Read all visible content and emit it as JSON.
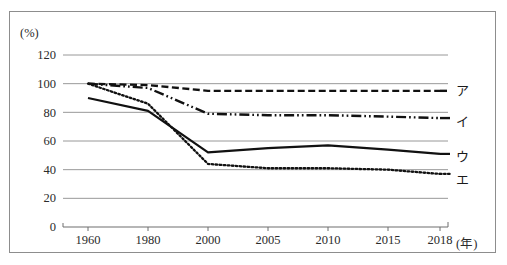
{
  "chart_data": {
    "type": "line",
    "title": "",
    "subtitle": "",
    "xlabel": "(年)",
    "ylabel": "(%)",
    "categories": [
      "1960",
      "1980",
      "2000",
      "2005",
      "2010",
      "2015",
      "2018"
    ],
    "ylim": [
      0,
      120
    ],
    "yticks": [
      0,
      20,
      40,
      60,
      80,
      100,
      120
    ],
    "ytick_labels": [
      "0",
      "20",
      "40",
      "60",
      "80",
      "100",
      "120"
    ],
    "grid": true,
    "grid_axis": "y",
    "legend_position": "right-inline",
    "series": [
      {
        "name": "ア",
        "label": "ア",
        "style": "dashed",
        "color": "#111111",
        "values": [
          100,
          99,
          95,
          95,
          95,
          95,
          95
        ]
      },
      {
        "name": "イ",
        "label": "イ",
        "style": "dash-dot-dot",
        "color": "#111111",
        "values": [
          100,
          97,
          79,
          78,
          78,
          77,
          76
        ]
      },
      {
        "name": "ウ",
        "label": "ウ",
        "style": "solid",
        "color": "#111111",
        "values": [
          90,
          81,
          52,
          55,
          57,
          54,
          51
        ]
      },
      {
        "name": "エ",
        "label": "エ",
        "style": "dotted",
        "color": "#111111",
        "values": [
          100,
          86,
          44,
          41,
          41,
          40,
          37
        ]
      }
    ],
    "axis_color": "#6f6f6f",
    "grid_color": "#8d8d8d",
    "frame_color": "#8d8d8d",
    "background": "#ffffff"
  },
  "geometry": {
    "plot_left": 63,
    "plot_right": 448,
    "y_at_0": 227,
    "y_at_120": 55,
    "x_positions": [
      88,
      148,
      208,
      268,
      328,
      388,
      440
    ],
    "legend_x": 455,
    "legend_y": [
      82,
      113,
      148,
      171
    ]
  }
}
